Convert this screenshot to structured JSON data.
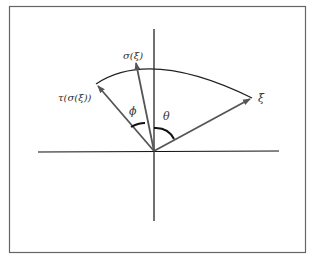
{
  "diagram": {
    "labels": {
      "xi": "ξ",
      "sigma_xi": "σ(ξ)",
      "tau_sigma_xi": "τ(σ(ξ))",
      "phi": "ϕ",
      "theta": "θ"
    },
    "colors": {
      "frame": "#555555",
      "axes": "#111111",
      "vectors": "#555555",
      "arc": "#222222",
      "angle_marks": "#111111"
    }
  }
}
